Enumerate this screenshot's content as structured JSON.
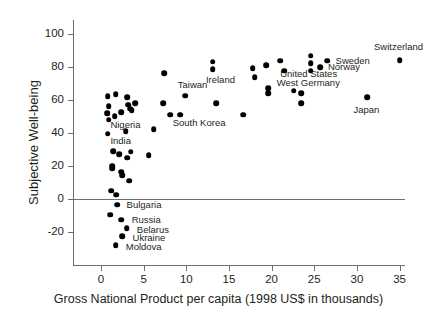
{
  "chart_data": {
    "type": "scatter",
    "title": "",
    "xlabel": "Gross National Product per capita (1998 US$ in thousands)",
    "ylabel": "Subjective Well-being",
    "xlim": [
      -1.5,
      36.5
    ],
    "ylim": [
      -30,
      100
    ],
    "xticks": [
      0,
      5,
      10,
      15,
      20,
      25,
      30,
      35
    ],
    "yticks": [
      -20,
      0,
      20,
      40,
      60,
      80,
      100
    ],
    "xtick_labels": [
      "0",
      "5",
      "10",
      "15",
      "20",
      "25",
      "30",
      "35"
    ],
    "ytick_labels": [
      "-20",
      "0",
      "20",
      "40",
      "60",
      "80",
      "100"
    ],
    "grid": false,
    "legend": false,
    "zero_reference_line": 0,
    "points": [
      {
        "x": 0.8,
        "y": 62,
        "label": ""
      },
      {
        "x": 1.7,
        "y": 63.5,
        "label": ""
      },
      {
        "x": 0.9,
        "y": 56,
        "label": ""
      },
      {
        "x": 3.1,
        "y": 61.5,
        "label": ""
      },
      {
        "x": 0.7,
        "y": 52,
        "label": ""
      },
      {
        "x": 1.6,
        "y": 50,
        "label": ""
      },
      {
        "x": 2.4,
        "y": 52.5,
        "label": ""
      },
      {
        "x": 3.2,
        "y": 57,
        "label": ""
      },
      {
        "x": 4.0,
        "y": 58,
        "label": ""
      },
      {
        "x": 3.4,
        "y": 54.5,
        "label": ""
      },
      {
        "x": 3.6,
        "y": 53.5,
        "label": ""
      },
      {
        "x": 0.9,
        "y": 48,
        "label": "Nigeria"
      },
      {
        "x": 0.8,
        "y": 39.5,
        "label": "India"
      },
      {
        "x": 2.9,
        "y": 41,
        "label": ""
      },
      {
        "x": 1.4,
        "y": 29,
        "label": ""
      },
      {
        "x": 2.1,
        "y": 27,
        "label": ""
      },
      {
        "x": 3.5,
        "y": 28.5,
        "label": ""
      },
      {
        "x": 3.1,
        "y": 25,
        "label": ""
      },
      {
        "x": 1.3,
        "y": 20,
        "label": ""
      },
      {
        "x": 1.3,
        "y": 18.5,
        "label": ""
      },
      {
        "x": 2.4,
        "y": 16.5,
        "label": ""
      },
      {
        "x": 2.5,
        "y": 14.5,
        "label": ""
      },
      {
        "x": 3.3,
        "y": 11,
        "label": ""
      },
      {
        "x": 1.2,
        "y": 5,
        "label": ""
      },
      {
        "x": 1.8,
        "y": 2.5,
        "label": ""
      },
      {
        "x": 1.9,
        "y": -3.5,
        "label": "Bulgaria"
      },
      {
        "x": 1.1,
        "y": -9.5,
        "label": ""
      },
      {
        "x": 2.4,
        "y": -12.5,
        "label": "Russia"
      },
      {
        "x": 3.0,
        "y": -17.5,
        "label": "Belarus"
      },
      {
        "x": 2.5,
        "y": -22.5,
        "label": "Ukraine"
      },
      {
        "x": 1.7,
        "y": -28,
        "label": "Moldova"
      },
      {
        "x": 5.6,
        "y": 26.5,
        "label": ""
      },
      {
        "x": 6.2,
        "y": 42,
        "label": ""
      },
      {
        "x": 7.4,
        "y": 76,
        "label": ""
      },
      {
        "x": 7.3,
        "y": 58,
        "label": ""
      },
      {
        "x": 8.1,
        "y": 51,
        "label": "South Korea"
      },
      {
        "x": 9.3,
        "y": 51,
        "label": ""
      },
      {
        "x": 9.9,
        "y": 62.5,
        "label": "Taiwan"
      },
      {
        "x": 13.1,
        "y": 83,
        "label": ""
      },
      {
        "x": 13.1,
        "y": 78.5,
        "label": "Ireland"
      },
      {
        "x": 13.5,
        "y": 58,
        "label": ""
      },
      {
        "x": 16.7,
        "y": 51,
        "label": ""
      },
      {
        "x": 17.8,
        "y": 79,
        "label": ""
      },
      {
        "x": 18.0,
        "y": 73.5,
        "label": ""
      },
      {
        "x": 19.4,
        "y": 81,
        "label": ""
      },
      {
        "x": 19.6,
        "y": 67,
        "label": ""
      },
      {
        "x": 19.6,
        "y": 64,
        "label": ""
      },
      {
        "x": 21.0,
        "y": 83.5,
        "label": ""
      },
      {
        "x": 21.5,
        "y": 77.5,
        "label": ""
      },
      {
        "x": 22.6,
        "y": 65.5,
        "label": "West Germany"
      },
      {
        "x": 23.5,
        "y": 64,
        "label": ""
      },
      {
        "x": 23.5,
        "y": 58,
        "label": ""
      },
      {
        "x": 24.6,
        "y": 86.5,
        "label": ""
      },
      {
        "x": 24.6,
        "y": 82,
        "label": ""
      },
      {
        "x": 24.6,
        "y": 77.5,
        "label": "United States"
      },
      {
        "x": 25.7,
        "y": 79.5,
        "label": "Norway"
      },
      {
        "x": 26.5,
        "y": 83.5,
        "label": "Sweden"
      },
      {
        "x": 31.2,
        "y": 61.5,
        "label": "Japan"
      },
      {
        "x": 35.0,
        "y": 84,
        "label": "Switzerland"
      }
    ],
    "annotations": [
      {
        "text": "Nigeria",
        "x": 1.1,
        "y": 45
      },
      {
        "text": "India",
        "x": 1.1,
        "y": 35
      },
      {
        "text": "Bulgaria",
        "x": 3.0,
        "y": -3.5
      },
      {
        "text": "Russia",
        "x": 3.6,
        "y": -12.5
      },
      {
        "text": "Belarus",
        "x": 4.2,
        "y": -18.5
      },
      {
        "text": "Ukraine",
        "x": 3.7,
        "y": -23.5
      },
      {
        "text": "Moldova",
        "x": 2.9,
        "y": -29
      },
      {
        "text": "South Korea",
        "x": 8.4,
        "y": 46
      },
      {
        "text": "Taiwan",
        "x": 9.0,
        "y": 69
      },
      {
        "text": "Ireland",
        "x": 12.3,
        "y": 72
      },
      {
        "text": "West Germany",
        "x": 20.6,
        "y": 70
      },
      {
        "text": "United States",
        "x": 21.0,
        "y": 75.5
      },
      {
        "text": "Norway",
        "x": 26.6,
        "y": 79.5
      },
      {
        "text": "Sweden",
        "x": 27.5,
        "y": 83.5
      },
      {
        "text": "Japan",
        "x": 29.6,
        "y": 54
      },
      {
        "text": "Switzerland",
        "x": 32.0,
        "y": 92
      }
    ]
  }
}
